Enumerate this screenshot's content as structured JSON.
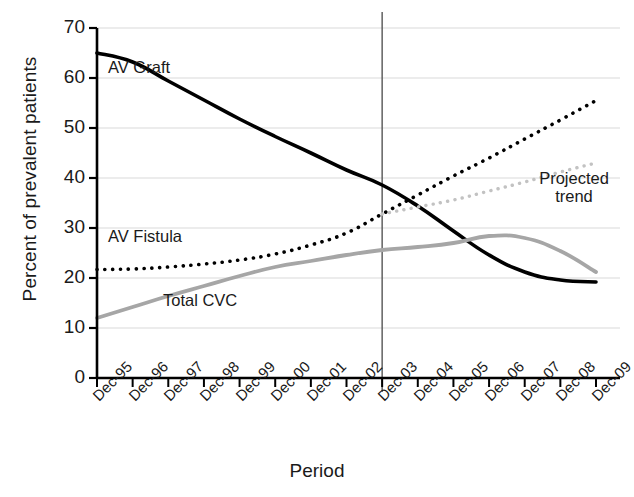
{
  "chart_data": {
    "type": "line",
    "title": "",
    "xlabel": "Period",
    "ylabel": "Percent of prevalent patients",
    "ylim": [
      0,
      70
    ],
    "yticks": [
      0,
      10,
      20,
      30,
      40,
      50,
      60,
      70
    ],
    "grid": true,
    "legend_position": "inline-annotations",
    "categories": [
      "Dec-95",
      "Dec-96",
      "Dec-97",
      "Dec-98",
      "Dec-99",
      "Dec-00",
      "Dec-01",
      "Dec-02",
      "Dec-03",
      "Dec-04",
      "Dec-05",
      "Dec-06",
      "Dec-07",
      "Dec-08",
      "Dec-09"
    ],
    "divider": {
      "at_category": "Dec-03",
      "label": "observed / projected split",
      "color": "#555555"
    },
    "series": [
      {
        "name": "AV Graft",
        "style": "solid",
        "color": "#000000",
        "width": 3.6,
        "values": [
          65.0,
          63.2,
          59.4,
          55.6,
          51.8,
          48.3,
          45.0,
          41.6,
          38.6,
          34.4,
          29.4,
          24.6,
          21.2,
          19.6,
          19.2
        ]
      },
      {
        "name": "AV Fistula",
        "style": "dotted",
        "color": "#000000",
        "width": 3.6,
        "values": [
          21.7,
          21.8,
          22.2,
          22.8,
          23.6,
          24.8,
          26.6,
          29.0,
          32.8,
          36.6,
          40.4,
          44.0,
          47.8,
          51.6,
          55.5
        ]
      },
      {
        "name": "Total CVC",
        "style": "solid",
        "color": "#a6a6a6",
        "width": 3.8,
        "values": [
          12.0,
          14.2,
          16.4,
          18.4,
          20.4,
          22.2,
          23.4,
          24.6,
          25.6,
          26.2,
          27.0,
          28.4,
          28.0,
          25.4,
          21.2
        ]
      },
      {
        "name": "Projected trend",
        "style": "dotted",
        "color": "#c2c2c2",
        "width": 3.4,
        "start_category": "Dec-03",
        "values": [
          null,
          null,
          null,
          null,
          null,
          null,
          null,
          null,
          32.8,
          34.2,
          35.6,
          37.4,
          39.2,
          41.2,
          43.0
        ]
      }
    ],
    "annotations": [
      {
        "text": "AV Graft",
        "x_px": 108,
        "y_px": 58,
        "name": "av-graft-label"
      },
      {
        "text": "AV Fistula",
        "x_px": 108,
        "y_px": 227,
        "name": "av-fistula-label"
      },
      {
        "text": "Total CVC",
        "x_px": 163,
        "y_px": 291,
        "name": "total-cvc-label"
      },
      {
        "text": "Projected trend",
        "x_px": 528,
        "y_px": 178,
        "name": "projected-trend-label"
      }
    ]
  },
  "axis": {
    "y_ticks": [
      "70",
      "60",
      "50",
      "40",
      "30",
      "20",
      "10",
      "0"
    ],
    "x_ticks": [
      "Dec-95",
      "Dec-96",
      "Dec-97",
      "Dec-98",
      "Dec-99",
      "Dec-00",
      "Dec-01",
      "Dec-02",
      "Dec-03",
      "Dec-04",
      "Dec-05",
      "Dec-06",
      "Dec-07",
      "Dec-08",
      "Dec-09"
    ],
    "y_title": "Percent of prevalent patients",
    "x_title": "Period"
  },
  "labels": {
    "av_graft": "AV Graft",
    "av_fistula": "AV Fistula",
    "total_cvc": "Total CVC",
    "projected_trend_line1": "Projected",
    "projected_trend_line2": "trend"
  },
  "colors": {
    "av_graft": "#000000",
    "av_fistula": "#000000",
    "total_cvc": "#a6a6a6",
    "projected_trend": "#c2c2c2",
    "grid": "#d9d9d9",
    "axis": "#000000",
    "divider": "#555555",
    "background": "#ffffff"
  }
}
